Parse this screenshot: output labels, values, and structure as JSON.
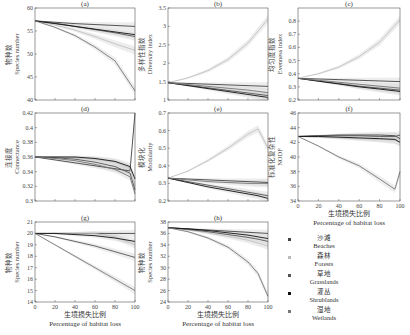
{
  "chart_data": [
    {
      "id": "a",
      "type": "line",
      "title": "(a)",
      "ylabel_cn": "物种数",
      "ylabel": "Species number",
      "ylim": [
        40,
        60
      ],
      "yticks": [
        "60",
        "55",
        "50",
        "45",
        "40"
      ],
      "xlim": [
        0,
        100
      ],
      "x": [
        0,
        20,
        40,
        60,
        80,
        100
      ],
      "series": [
        {
          "name": "Beaches",
          "values": [
            57.2,
            56.9,
            56.6,
            56.4,
            56.2,
            56.0
          ]
        },
        {
          "name": "Forests",
          "values": [
            57.2,
            56.3,
            55.2,
            53.8,
            52.2,
            50.8
          ]
        },
        {
          "name": "Grasslands",
          "values": [
            57.2,
            56.7,
            56.0,
            55.3,
            54.6,
            53.8
          ]
        },
        {
          "name": "Shrublands",
          "values": [
            57.2,
            56.6,
            56.0,
            55.4,
            54.8,
            54.2
          ]
        },
        {
          "name": "Wetlands",
          "values": [
            57.2,
            55.8,
            54.0,
            51.5,
            48.5,
            42.0
          ]
        }
      ]
    },
    {
      "id": "b",
      "type": "line",
      "title": "(b)",
      "ylabel_cn": "多样性指数",
      "ylabel": "Diversity index",
      "ylim": [
        1,
        3.5
      ],
      "yticks": [
        "3.5",
        "3",
        "2.5",
        "2",
        "1.5",
        "1"
      ],
      "xlim": [
        0,
        100
      ],
      "x": [
        0,
        20,
        40,
        60,
        80,
        100
      ],
      "series": [
        {
          "name": "Beaches",
          "values": [
            1.47,
            1.45,
            1.43,
            1.41,
            1.39,
            1.37
          ]
        },
        {
          "name": "Forests",
          "values": [
            1.47,
            1.6,
            1.8,
            2.1,
            2.55,
            3.2
          ]
        },
        {
          "name": "Grasslands",
          "values": [
            1.47,
            1.4,
            1.33,
            1.26,
            1.19,
            1.12
          ]
        },
        {
          "name": "Shrublands",
          "values": [
            1.47,
            1.39,
            1.31,
            1.23,
            1.15,
            1.07
          ]
        },
        {
          "name": "Wetlands",
          "values": [
            1.47,
            1.42,
            1.37,
            1.32,
            1.27,
            1.2
          ]
        }
      ]
    },
    {
      "id": "c",
      "type": "line",
      "title": "(c)",
      "ylabel_cn": "均匀度指数",
      "ylabel": "Evenness index",
      "ylim": [
        0.2,
        0.9
      ],
      "yticks": [
        "0.8",
        "0.7",
        "0.6",
        "0.5",
        "0.4",
        "0.3",
        "0.2"
      ],
      "xlim": [
        0,
        100
      ],
      "x": [
        0,
        20,
        40,
        60,
        80,
        100
      ],
      "series": [
        {
          "name": "Beaches",
          "values": [
            0.365,
            0.36,
            0.355,
            0.35,
            0.345,
            0.34
          ]
        },
        {
          "name": "Forests",
          "values": [
            0.365,
            0.4,
            0.45,
            0.53,
            0.64,
            0.81
          ]
        },
        {
          "name": "Grasslands",
          "values": [
            0.365,
            0.345,
            0.325,
            0.305,
            0.29,
            0.275
          ]
        },
        {
          "name": "Shrublands",
          "values": [
            0.365,
            0.343,
            0.322,
            0.3,
            0.283,
            0.265
          ]
        },
        {
          "name": "Wetlands",
          "values": [
            0.365,
            0.35,
            0.335,
            0.32,
            0.305,
            0.29
          ]
        }
      ]
    },
    {
      "id": "d",
      "type": "line",
      "title": "(d)",
      "ylabel_cn": "连接度",
      "ylabel": "Connectance",
      "ylim": [
        0.3,
        0.42
      ],
      "yticks": [
        "0.42",
        "0.4",
        "0.38",
        "0.36",
        "0.34",
        "0.32",
        "0.3"
      ],
      "xlim": [
        0,
        100
      ],
      "x": [
        0,
        20,
        40,
        60,
        80,
        95,
        100
      ],
      "series": [
        {
          "name": "Beaches",
          "values": [
            0.36,
            0.356,
            0.352,
            0.348,
            0.344,
            0.341,
            0.42
          ]
        },
        {
          "name": "Forests",
          "values": [
            0.36,
            0.36,
            0.359,
            0.357,
            0.353,
            0.345,
            0.32
          ]
        },
        {
          "name": "Grasslands",
          "values": [
            0.36,
            0.359,
            0.357,
            0.353,
            0.347,
            0.338,
            0.315
          ]
        },
        {
          "name": "Shrublands",
          "values": [
            0.36,
            0.36,
            0.36,
            0.358,
            0.354,
            0.347,
            0.33
          ]
        },
        {
          "name": "Wetlands",
          "values": [
            0.36,
            0.358,
            0.355,
            0.35,
            0.343,
            0.333,
            0.31
          ]
        }
      ]
    },
    {
      "id": "e",
      "type": "line",
      "title": "(e)",
      "ylabel_cn": "模块化",
      "ylabel": "Modularity",
      "ylim": [
        0.2,
        0.7
      ],
      "yticks": [
        "0.7",
        "0.6",
        "0.5",
        "0.4",
        "0.3",
        "0.2"
      ],
      "xlim": [
        0,
        100
      ],
      "x": [
        0,
        20,
        40,
        60,
        80,
        90,
        100
      ],
      "series": [
        {
          "name": "Beaches",
          "values": [
            0.33,
            0.325,
            0.32,
            0.315,
            0.31,
            0.308,
            0.305
          ]
        },
        {
          "name": "Forests",
          "values": [
            0.33,
            0.37,
            0.43,
            0.5,
            0.58,
            0.61,
            0.5
          ]
        },
        {
          "name": "Grasslands",
          "values": [
            0.33,
            0.31,
            0.29,
            0.27,
            0.25,
            0.24,
            0.23
          ]
        },
        {
          "name": "Shrublands",
          "values": [
            0.33,
            0.305,
            0.28,
            0.26,
            0.24,
            0.23,
            0.215
          ]
        },
        {
          "name": "Wetlands",
          "values": [
            0.33,
            0.32,
            0.31,
            0.305,
            0.3,
            0.3,
            0.3
          ]
        }
      ]
    },
    {
      "id": "f",
      "type": "line",
      "title": "(f)",
      "ylabel_cn": "标准化复杂性",
      "ylabel": "NODF",
      "ylim": [
        34,
        46
      ],
      "yticks": [
        "46",
        "44",
        "42",
        "40",
        "38",
        "36",
        "34"
      ],
      "xlim": [
        0,
        100
      ],
      "xticks": [
        "0",
        "20",
        "40",
        "60",
        "80",
        "100"
      ],
      "xlabel_cn": "生境损失比例",
      "xlabel": "Percentage of habitat loss",
      "x": [
        0,
        20,
        40,
        60,
        80,
        95,
        100
      ],
      "series": [
        {
          "name": "Beaches",
          "values": [
            42.8,
            42.9,
            43.0,
            43.0,
            43.0,
            42.9,
            42.5
          ]
        },
        {
          "name": "Forests",
          "values": [
            42.8,
            42.7,
            42.6,
            42.5,
            42.4,
            42.3,
            42.0
          ]
        },
        {
          "name": "Grasslands",
          "values": [
            42.8,
            42.9,
            42.9,
            42.9,
            42.8,
            42.8,
            43.0
          ]
        },
        {
          "name": "Shrublands",
          "values": [
            42.8,
            42.8,
            42.7,
            42.6,
            42.5,
            42.4,
            42.0
          ]
        },
        {
          "name": "Wetlands",
          "values": [
            42.8,
            41.5,
            40.0,
            38.8,
            37.0,
            35.6,
            38.0
          ]
        }
      ]
    },
    {
      "id": "g",
      "type": "line",
      "title": "(g)",
      "ylabel_cn": "物种数",
      "ylabel": "Species number",
      "ylim": [
        14,
        21
      ],
      "yticks": [
        "21",
        "20",
        "19",
        "18",
        "17",
        "16",
        "15",
        "14"
      ],
      "xlim": [
        0,
        100
      ],
      "xticks": [
        "0",
        "20",
        "40",
        "60",
        "80",
        "100"
      ],
      "xlabel_cn": "生境损失比例",
      "xlabel": "Percentage of habitat loss",
      "x": [
        0,
        20,
        40,
        60,
        80,
        100
      ],
      "series": [
        {
          "name": "Beaches",
          "values": [
            20,
            20,
            20,
            20,
            20,
            20
          ]
        },
        {
          "name": "Forests",
          "values": [
            20,
            20,
            20,
            20,
            19.7,
            19.0
          ]
        },
        {
          "name": "Grasslands",
          "values": [
            20,
            19.7,
            19.3,
            18.9,
            18.4,
            17.9
          ]
        },
        {
          "name": "Shrublands",
          "values": [
            20,
            20,
            19.9,
            19.8,
            19.6,
            19.3
          ]
        },
        {
          "name": "Wetlands",
          "values": [
            20,
            19.0,
            18.0,
            17.0,
            16.0,
            15.0
          ]
        }
      ]
    },
    {
      "id": "h",
      "type": "line",
      "title": "(h)",
      "ylabel_cn": "物种数",
      "ylabel": "Species number",
      "ylim": [
        24,
        38
      ],
      "yticks": [
        "38",
        "36",
        "34",
        "32",
        "30",
        "28",
        "26",
        "24"
      ],
      "xlim": [
        0,
        100
      ],
      "xticks": [
        "0",
        "20",
        "40",
        "60",
        "80",
        "100"
      ],
      "xlabel_cn": "生境损失比例",
      "xlabel": "Percentage of habitat loss",
      "x": [
        0,
        20,
        40,
        60,
        80,
        90,
        100
      ],
      "series": [
        {
          "name": "Beaches",
          "values": [
            37,
            36.8,
            36.6,
            36.4,
            36.2,
            36.1,
            36
          ]
        },
        {
          "name": "Forests",
          "values": [
            37,
            36.6,
            36.1,
            35.5,
            34.8,
            34.3,
            33.8
          ]
        },
        {
          "name": "Grasslands",
          "values": [
            37,
            36.7,
            36.3,
            35.8,
            35.3,
            35.0,
            34.6
          ]
        },
        {
          "name": "Shrublands",
          "values": [
            37,
            36.8,
            36.5,
            36.1,
            35.7,
            35.4,
            35.1
          ]
        },
        {
          "name": "Wetlands",
          "values": [
            37,
            36.3,
            35.2,
            33.6,
            31.0,
            29.0,
            25.0
          ]
        }
      ]
    }
  ],
  "legend": [
    {
      "cn": "沙滩",
      "en": "Beaches",
      "color": "#444444"
    },
    {
      "cn": "森林",
      "en": "Forests",
      "color": "#bdbdbd"
    },
    {
      "cn": "草地",
      "en": "Grasslands",
      "color": "#555555"
    },
    {
      "cn": "灌丛",
      "en": "Shrublands",
      "color": "#111111"
    },
    {
      "cn": "湿地",
      "en": "Wetlands",
      "color": "#777777"
    }
  ]
}
